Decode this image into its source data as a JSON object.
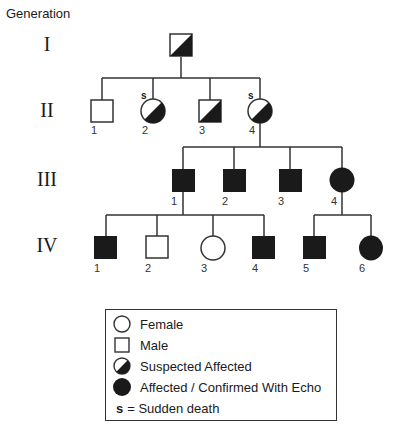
{
  "header": {
    "title": "Generation"
  },
  "generations": [
    {
      "label": "I",
      "y": 33
    },
    {
      "label": "II",
      "y": 99
    },
    {
      "label": "III",
      "y": 168
    },
    {
      "label": "IV",
      "y": 234
    }
  ],
  "individuals": {
    "I": [
      {
        "id": "I",
        "sex": "male",
        "status": "suspected",
        "cx": 181,
        "cy": 45,
        "number": "",
        "sudden_death": false
      }
    ],
    "II": [
      {
        "number": "1",
        "sex": "male",
        "status": "unaffected",
        "cx": 102,
        "cy": 111,
        "sudden_death": false
      },
      {
        "number": "2",
        "sex": "female",
        "status": "suspected",
        "cx": 153,
        "cy": 111,
        "sudden_death": true
      },
      {
        "number": "3",
        "sex": "male",
        "status": "suspected",
        "cx": 210,
        "cy": 111,
        "sudden_death": false
      },
      {
        "number": "4",
        "sex": "female",
        "status": "suspected",
        "cx": 260,
        "cy": 111,
        "sudden_death": true
      }
    ],
    "III": [
      {
        "number": "1",
        "sex": "male",
        "status": "affected",
        "cx": 183,
        "cy": 180
      },
      {
        "number": "2",
        "sex": "male",
        "status": "affected",
        "cx": 234,
        "cy": 180
      },
      {
        "number": "3",
        "sex": "male",
        "status": "affected",
        "cx": 290,
        "cy": 180
      },
      {
        "number": "4",
        "sex": "female",
        "status": "affected",
        "cx": 342,
        "cy": 180
      }
    ],
    "IV": [
      {
        "number": "1",
        "sex": "male",
        "status": "affected",
        "cx": 106,
        "cy": 247
      },
      {
        "number": "2",
        "sex": "male",
        "status": "unaffected",
        "cx": 157,
        "cy": 247
      },
      {
        "number": "3",
        "sex": "female",
        "status": "unaffected",
        "cx": 213,
        "cy": 247
      },
      {
        "number": "4",
        "sex": "male",
        "status": "affected",
        "cx": 264,
        "cy": 247
      },
      {
        "number": "5",
        "sex": "male",
        "status": "affected",
        "cx": 314,
        "cy": 247
      },
      {
        "number": "6",
        "sex": "female",
        "status": "affected",
        "cx": 371,
        "cy": 247
      }
    ]
  },
  "sudden_death_marker": "s",
  "legend": {
    "items": [
      {
        "icon": "female-circle-icon",
        "label": "Female"
      },
      {
        "icon": "male-square-icon",
        "label": "Male"
      },
      {
        "icon": "suspected-affected-icon",
        "label": "Suspected Affected"
      },
      {
        "icon": "affected-icon",
        "label": "Affected / Confirmed With Echo"
      }
    ],
    "sudden_death": {
      "symbol": "s",
      "label": "= Sudden death"
    }
  },
  "colors": {
    "line": "#333333",
    "fill": "#1a1a1a",
    "background": "#ffffff"
  }
}
